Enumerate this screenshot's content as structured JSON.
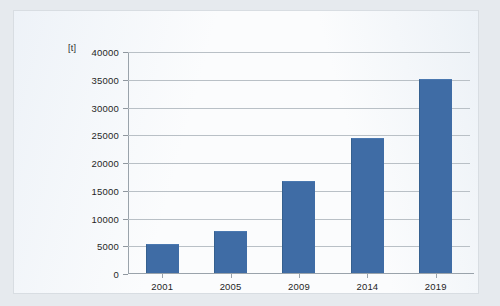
{
  "chart_data": {
    "type": "bar",
    "title": "",
    "xlabel": "",
    "ylabel": "[t]",
    "unit_label": "[t]",
    "categories": [
      "2001",
      "2005",
      "2009",
      "2014",
      "2019"
    ],
    "values": [
      5300,
      7600,
      16600,
      24500,
      35200
    ],
    "series": [
      {
        "name": "",
        "values": [
          5300,
          7600,
          16600,
          24500,
          35200
        ]
      }
    ],
    "ylim": [
      0,
      40000
    ],
    "ytick_values": [
      0,
      5000,
      10000,
      15000,
      20000,
      25000,
      30000,
      35000,
      40000
    ],
    "ytick_labels": [
      "0",
      "5000",
      "10000",
      "15000",
      "20000",
      "25000",
      "30000",
      "35000",
      "40000"
    ],
    "grid": true,
    "legend": false,
    "legend_position": "none",
    "bar_color": "#3f6ca5",
    "gridline_color": "#b9c0c6",
    "axis_color": "#9aa3ab",
    "plot_background": "#fbfcfd",
    "page_background": "#e6eaee"
  }
}
